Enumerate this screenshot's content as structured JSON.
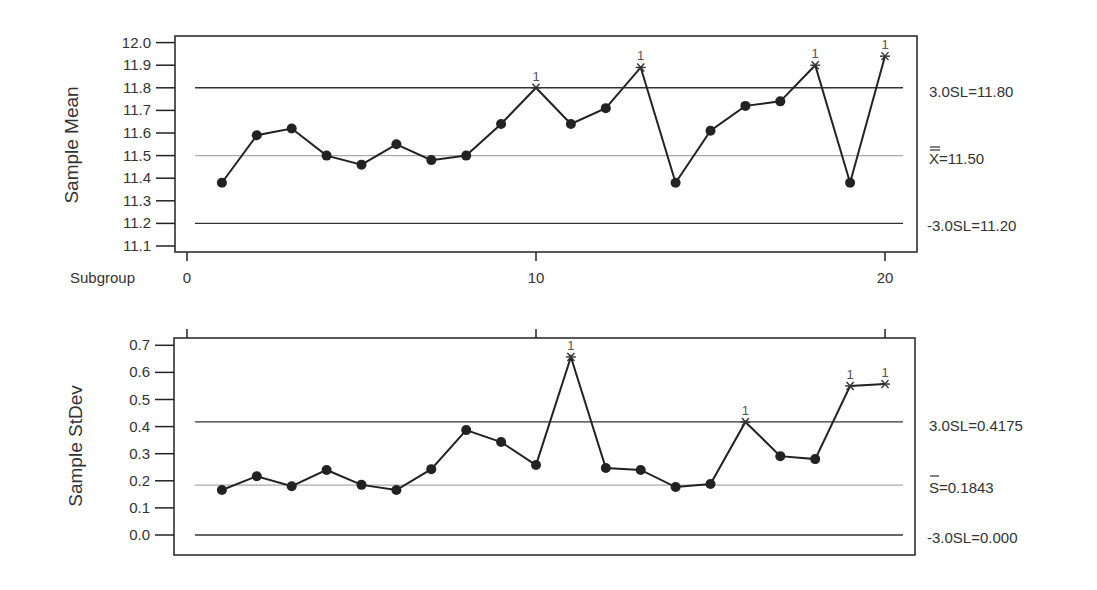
{
  "chart_data": [
    {
      "type": "line",
      "title": "Xbar Chart",
      "ylabel": "Sample Mean",
      "xlabel": "Subgroup",
      "ylim": [
        11.1,
        12.0
      ],
      "yticks": [
        "12.0",
        "11.9",
        "11.8",
        "11.7",
        "11.6",
        "11.5",
        "11.4",
        "11.3",
        "11.2",
        "11.1"
      ],
      "xticks": [
        "0",
        "10",
        "20"
      ],
      "x": [
        1,
        2,
        3,
        4,
        5,
        6,
        7,
        8,
        9,
        10,
        11,
        12,
        13,
        14,
        15,
        16,
        17,
        18,
        19,
        20
      ],
      "series": [
        {
          "name": "Sample Mean",
          "values": [
            11.38,
            11.59,
            11.62,
            11.5,
            11.46,
            11.55,
            11.48,
            11.5,
            11.64,
            11.8,
            11.64,
            11.71,
            11.89,
            11.38,
            11.61,
            11.72,
            11.74,
            11.9,
            11.38,
            11.94
          ]
        }
      ],
      "flagged_points": [
        10,
        13,
        18,
        20
      ],
      "flag_label": "1",
      "control_limits": {
        "ucl": {
          "value": 11.8,
          "label": "3.0SL=11.80"
        },
        "center": {
          "value": 11.5,
          "label": "X=11.50",
          "symbol": "X double-bar"
        },
        "lcl": {
          "value": 11.2,
          "label": "-3.0SL=11.20"
        }
      },
      "grid": false
    },
    {
      "type": "line",
      "title": "S Chart",
      "ylabel": "Sample StDev",
      "xlabel": "",
      "ylim": [
        0.0,
        0.7
      ],
      "yticks": [
        "0.7",
        "0.6",
        "0.5",
        "0.4",
        "0.3",
        "0.2",
        "0.1",
        "0.0"
      ],
      "x": [
        1,
        2,
        3,
        4,
        5,
        6,
        7,
        8,
        9,
        10,
        11,
        12,
        13,
        14,
        15,
        16,
        17,
        18,
        19,
        20
      ],
      "series": [
        {
          "name": "Sample StDev",
          "values": [
            0.166,
            0.217,
            0.18,
            0.24,
            0.185,
            0.166,
            0.243,
            0.387,
            0.343,
            0.258,
            0.657,
            0.247,
            0.24,
            0.177,
            0.188,
            0.417,
            0.291,
            0.28,
            0.55,
            0.557
          ]
        }
      ],
      "flagged_points": [
        11,
        16,
        19,
        20
      ],
      "flag_label": "1",
      "control_limits": {
        "ucl": {
          "value": 0.4175,
          "label": "3.0SL=0.4175"
        },
        "center": {
          "value": 0.1843,
          "label": "S=0.1843",
          "symbol": "S bar"
        },
        "lcl": {
          "value": 0.0,
          "label": "-3.0SL=0.000"
        }
      },
      "grid": false
    }
  ],
  "labels": {
    "top_ylabel": "Sample Mean",
    "bottom_ylabel": "Sample StDev",
    "subgroup_label": "Subgroup",
    "top_ucl": "3.0SL=11.80",
    "top_cl_rest": "=11.50",
    "top_cl_symbol": "X",
    "top_lcl": "-3.0SL=11.20",
    "bottom_ucl": "3.0SL=0.4175",
    "bottom_cl_symbol": "S",
    "bottom_cl_rest": "=0.1843",
    "bottom_lcl": "-3.0SL=0.000"
  },
  "colors": {
    "line": "#222222",
    "center_line": "#aaaaaa",
    "limit_line": "#333333",
    "frame": "#222222",
    "flag": "#555555"
  }
}
